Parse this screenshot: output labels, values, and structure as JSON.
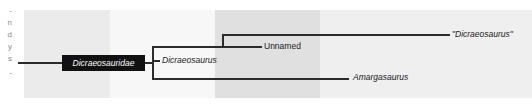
{
  "figure": {
    "type": "cladogram",
    "clade_box": {
      "label": "Dicraeosauridae"
    },
    "taxa": [
      {
        "name": "dicraeosaurus-quoted",
        "label": "\"Dicraeosaurus\"",
        "style": "italic",
        "x": 452,
        "y": 33
      },
      {
        "name": "unnamed-node",
        "label": "Unnamed",
        "style": "upright",
        "x": 264,
        "y": 46
      },
      {
        "name": "dicraeosaurus",
        "label": "Dicraeosaurus",
        "style": "italic",
        "x": 160,
        "y": 58
      },
      {
        "name": "amargasaurus",
        "label": "Amargasaurus",
        "style": "italic",
        "x": 351,
        "y": 71
      }
    ],
    "gutter_fragments": [
      "-",
      "n",
      "d",
      "y",
      "s",
      "-"
    ],
    "colors": {
      "line": "#2b2b2b",
      "clade_box_fill": "#111111",
      "clade_box_text": "#ffffff",
      "band_light": "#f7f7f7",
      "band_mid": "#ebebeb",
      "band_dark": "#e0e0e0",
      "background": "#ffffff"
    },
    "bands": [
      {
        "name": "band-1",
        "x": 24,
        "width": 86,
        "shade": "band-a"
      },
      {
        "name": "band-2",
        "x": 110,
        "width": 105,
        "shade": "band-b"
      },
      {
        "name": "band-3",
        "x": 215,
        "width": 105,
        "shade": "band-c"
      },
      {
        "name": "band-4",
        "x": 320,
        "width": 212,
        "shade": "band-d"
      }
    ]
  }
}
